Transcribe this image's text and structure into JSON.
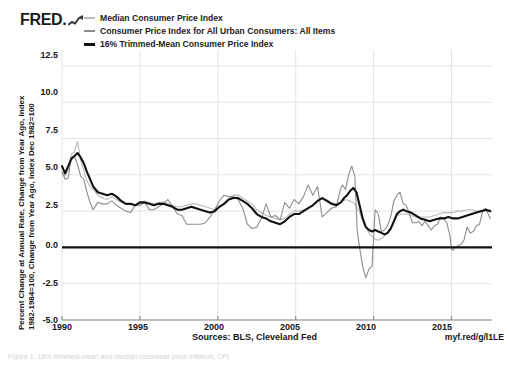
{
  "brand": {
    "name": "FRED",
    "logo_icon": "fred-chart-glyph"
  },
  "legend": {
    "position": "top",
    "items": [
      {
        "label": "Median Consumer Price Index",
        "color": "#b9b9b9",
        "swatch_icon": "line-swatch-icon"
      },
      {
        "label": "Consumer Price Index for All Urban Consumers: All Items",
        "color": "#8d8d8d",
        "swatch_icon": "line-swatch-icon"
      },
      {
        "label": "16% Trimmed-Mean Consumer Price Index",
        "color": "#111111",
        "swatch_icon": "line-swatch-icon"
      }
    ]
  },
  "axes": {
    "ylabel_line1": "Percent Change at Annual Rate, Change from Year Ago, Index",
    "ylabel_line2": "1982-1984=100, Change from Year Ago, Index Dec 1982=100",
    "yticks": [
      "12.5",
      "10.0",
      "7.5",
      "5.0",
      "2.5",
      "0.0",
      "-2.5",
      "-5.0"
    ],
    "xticks": [
      "1990",
      "1995",
      "2000",
      "2005",
      "2010",
      "2015"
    ]
  },
  "footer": {
    "sources": "Sources: BLS, Cleveland Fed",
    "short_url": "myf.red/g/l1LE",
    "caption": "Figure 1: 16% trimmed-mean and median consumer price inflation, CPI"
  },
  "chart_data": {
    "type": "line",
    "title": "",
    "xlabel": "",
    "ylabel": "Percent Change at Annual Rate, Change from Year Ago, Index 1982-1984=100, Change from Year Ago, Index Dec 1982=100",
    "xlim": [
      1990.0,
      2017.6
    ],
    "ylim": [
      -5.0,
      13.6
    ],
    "ytick_values": [
      12.5,
      10.0,
      7.5,
      5.0,
      2.5,
      0.0,
      -2.5,
      -5.0
    ],
    "xtick_values": [
      1990,
      1995,
      2000,
      2005,
      2010,
      2015
    ],
    "grid": true,
    "grid_color": "#dcdcdc",
    "zero_line": true,
    "zero_line_color": "#111111",
    "legend_position": "top",
    "series": [
      {
        "name": "Median Consumer Price Index",
        "color": "#b9b9b9",
        "width": 1.1,
        "x": [
          1990.0,
          1990.2,
          1990.4,
          1990.6,
          1990.8,
          1991.0,
          1991.2,
          1991.4,
          1991.6,
          1991.8,
          1992.0,
          1992.3,
          1992.6,
          1992.9,
          1993.2,
          1993.5,
          1993.8,
          1994.1,
          1994.4,
          1994.7,
          1995.0,
          1995.3,
          1995.6,
          1995.9,
          1996.2,
          1996.5,
          1996.8,
          1997.1,
          1997.4,
          1997.7,
          1998.0,
          1998.3,
          1998.6,
          1998.9,
          1999.2,
          1999.5,
          1999.8,
          2000.1,
          2000.4,
          2000.7,
          2001.0,
          2001.3,
          2001.6,
          2001.9,
          2002.2,
          2002.5,
          2002.8,
          2003.1,
          2003.4,
          2003.7,
          2004.0,
          2004.3,
          2004.6,
          2004.9,
          2005.2,
          2005.5,
          2005.8,
          2006.1,
          2006.4,
          2006.7,
          2007.0,
          2007.3,
          2007.6,
          2007.9,
          2008.2,
          2008.5,
          2008.8,
          2009.1,
          2009.4,
          2009.7,
          2010.0,
          2010.3,
          2010.6,
          2010.9,
          2011.2,
          2011.5,
          2011.8,
          2012.1,
          2012.4,
          2012.7,
          2013.0,
          2013.3,
          2013.6,
          2013.9,
          2014.2,
          2014.5,
          2014.8,
          2015.1,
          2015.4,
          2015.7,
          2016.0,
          2016.3,
          2016.6,
          2016.9,
          2017.2,
          2017.5
        ],
        "y": [
          5.2,
          4.9,
          5.4,
          6.4,
          6.6,
          7.3,
          6.0,
          5.3,
          4.6,
          4.2,
          4.0,
          3.6,
          3.4,
          3.3,
          3.5,
          3.3,
          3.1,
          3.0,
          3.0,
          2.9,
          3.0,
          3.2,
          3.1,
          3.0,
          3.1,
          3.1,
          3.0,
          2.9,
          2.8,
          2.8,
          2.9,
          3.0,
          3.0,
          2.9,
          2.8,
          2.7,
          2.6,
          2.8,
          3.0,
          3.3,
          3.6,
          3.6,
          3.4,
          3.2,
          3.0,
          2.6,
          2.4,
          2.2,
          2.1,
          2.0,
          1.9,
          2.0,
          2.3,
          2.5,
          2.5,
          2.6,
          2.7,
          2.9,
          3.2,
          3.4,
          3.3,
          3.1,
          3.0,
          3.1,
          3.3,
          3.2,
          3.0,
          2.4,
          1.6,
          1.0,
          0.6,
          0.5,
          0.7,
          1.0,
          1.5,
          2.2,
          2.3,
          2.3,
          2.2,
          2.1,
          2.1,
          2.1,
          2.1,
          2.2,
          2.3,
          2.4,
          2.4,
          2.4,
          2.5,
          2.5,
          2.6,
          2.6,
          2.5,
          2.5,
          2.5,
          2.6
        ]
      },
      {
        "name": "Consumer Price Index for All Urban Consumers: All Items",
        "color": "#8d8d8d",
        "width": 1.1,
        "x": [
          1990.0,
          1990.2,
          1990.4,
          1990.6,
          1990.8,
          1991.0,
          1991.2,
          1991.4,
          1991.6,
          1991.8,
          1992.0,
          1992.3,
          1992.6,
          1992.9,
          1993.2,
          1993.5,
          1993.8,
          1994.1,
          1994.4,
          1994.7,
          1995.0,
          1995.3,
          1995.6,
          1995.9,
          1996.2,
          1996.5,
          1996.8,
          1997.1,
          1997.4,
          1997.7,
          1998.0,
          1998.3,
          1998.6,
          1998.9,
          1999.2,
          1999.5,
          1999.8,
          2000.1,
          2000.4,
          2000.7,
          2001.0,
          2001.3,
          2001.6,
          2001.9,
          2002.2,
          2002.5,
          2002.8,
          2003.1,
          2003.4,
          2003.7,
          2004.0,
          2004.3,
          2004.6,
          2004.9,
          2005.2,
          2005.5,
          2005.8,
          2006.1,
          2006.4,
          2006.7,
          2007.0,
          2007.3,
          2007.6,
          2007.9,
          2008.0,
          2008.2,
          2008.4,
          2008.6,
          2008.8,
          2008.95,
          2009.1,
          2009.3,
          2009.5,
          2009.7,
          2009.9,
          2010.1,
          2010.3,
          2010.5,
          2010.7,
          2010.9,
          2011.1,
          2011.3,
          2011.5,
          2011.7,
          2011.9,
          2012.1,
          2012.3,
          2012.5,
          2012.7,
          2012.9,
          2013.1,
          2013.3,
          2013.5,
          2013.7,
          2013.9,
          2014.1,
          2014.3,
          2014.5,
          2014.7,
          2014.9,
          2015.0,
          2015.1,
          2015.2,
          2015.4,
          2015.6,
          2015.8,
          2016.0,
          2016.2,
          2016.4,
          2016.6,
          2016.8,
          2017.0,
          2017.2,
          2017.4,
          2017.5
        ],
        "y": [
          5.2,
          4.7,
          4.8,
          6.2,
          6.3,
          5.7,
          4.9,
          4.7,
          3.8,
          3.1,
          2.6,
          3.1,
          3.0,
          3.0,
          3.2,
          2.9,
          2.7,
          2.5,
          2.4,
          2.9,
          2.9,
          3.1,
          2.6,
          2.6,
          2.8,
          3.0,
          3.3,
          2.8,
          2.3,
          2.2,
          1.6,
          1.6,
          1.6,
          1.6,
          1.7,
          2.1,
          2.6,
          3.2,
          3.6,
          3.5,
          3.5,
          3.3,
          2.7,
          1.6,
          1.3,
          1.4,
          2.0,
          3.0,
          2.1,
          2.2,
          1.9,
          3.1,
          2.7,
          3.3,
          3.0,
          3.5,
          4.3,
          3.6,
          4.2,
          2.1,
          2.4,
          2.7,
          2.8,
          4.1,
          4.3,
          4.0,
          5.0,
          5.6,
          4.9,
          1.1,
          0.0,
          -1.3,
          -2.1,
          -1.5,
          -1.3,
          2.6,
          2.3,
          1.1,
          1.2,
          1.5,
          2.1,
          3.2,
          3.6,
          3.8,
          3.0,
          2.9,
          2.3,
          1.7,
          1.7,
          1.8,
          1.5,
          1.8,
          1.5,
          1.2,
          1.5,
          1.6,
          2.1,
          2.0,
          1.7,
          0.8,
          -0.1,
          -0.2,
          0.0,
          0.1,
          0.2,
          0.5,
          1.4,
          1.0,
          1.1,
          1.5,
          1.6,
          2.5,
          2.7,
          2.2,
          2.0
        ]
      },
      {
        "name": "16% Trimmed-Mean Consumer Price Index",
        "color": "#111111",
        "width": 2.1,
        "x": [
          1990.0,
          1990.2,
          1990.4,
          1990.6,
          1990.8,
          1991.0,
          1991.2,
          1991.4,
          1991.6,
          1991.8,
          1992.0,
          1992.3,
          1992.6,
          1992.9,
          1993.2,
          1993.5,
          1993.8,
          1994.1,
          1994.4,
          1994.7,
          1995.0,
          1995.3,
          1995.6,
          1995.9,
          1996.2,
          1996.5,
          1996.8,
          1997.1,
          1997.4,
          1997.7,
          1998.0,
          1998.3,
          1998.6,
          1998.9,
          1999.2,
          1999.5,
          1999.8,
          2000.1,
          2000.4,
          2000.7,
          2001.0,
          2001.3,
          2001.6,
          2001.9,
          2002.2,
          2002.5,
          2002.8,
          2003.1,
          2003.4,
          2003.7,
          2004.0,
          2004.3,
          2004.6,
          2004.9,
          2005.2,
          2005.5,
          2005.8,
          2006.1,
          2006.4,
          2006.7,
          2007.0,
          2007.3,
          2007.6,
          2007.9,
          2008.1,
          2008.3,
          2008.5,
          2008.7,
          2008.9,
          2009.1,
          2009.3,
          2009.5,
          2009.7,
          2009.9,
          2010.1,
          2010.3,
          2010.5,
          2010.7,
          2010.9,
          2011.1,
          2011.3,
          2011.5,
          2011.7,
          2011.9,
          2012.1,
          2012.4,
          2012.7,
          2013.0,
          2013.3,
          2013.6,
          2013.9,
          2014.2,
          2014.5,
          2014.8,
          2015.1,
          2015.4,
          2015.7,
          2016.0,
          2016.3,
          2016.6,
          2016.9,
          2017.2,
          2017.5
        ],
        "y": [
          5.6,
          5.1,
          5.6,
          6.1,
          6.3,
          6.5,
          6.2,
          5.8,
          5.2,
          4.7,
          4.2,
          3.8,
          3.7,
          3.6,
          3.7,
          3.5,
          3.2,
          3.0,
          3.0,
          2.9,
          3.1,
          3.1,
          3.0,
          2.9,
          3.0,
          3.0,
          2.9,
          2.8,
          2.6,
          2.6,
          2.7,
          2.8,
          2.7,
          2.6,
          2.5,
          2.4,
          2.5,
          2.8,
          3.0,
          3.3,
          3.4,
          3.4,
          3.2,
          3.0,
          2.7,
          2.3,
          2.1,
          2.0,
          1.8,
          1.7,
          1.6,
          1.8,
          2.1,
          2.3,
          2.3,
          2.5,
          2.7,
          2.9,
          3.2,
          3.4,
          3.2,
          3.0,
          2.9,
          3.1,
          3.4,
          3.6,
          3.9,
          4.1,
          3.8,
          2.9,
          2.0,
          1.4,
          1.2,
          1.1,
          1.2,
          1.1,
          1.0,
          0.9,
          1.0,
          1.3,
          1.8,
          2.3,
          2.5,
          2.6,
          2.5,
          2.4,
          2.2,
          2.0,
          1.9,
          1.8,
          1.9,
          2.0,
          2.0,
          2.1,
          2.0,
          2.0,
          2.1,
          2.2,
          2.3,
          2.4,
          2.5,
          2.6,
          2.5
        ]
      }
    ]
  }
}
